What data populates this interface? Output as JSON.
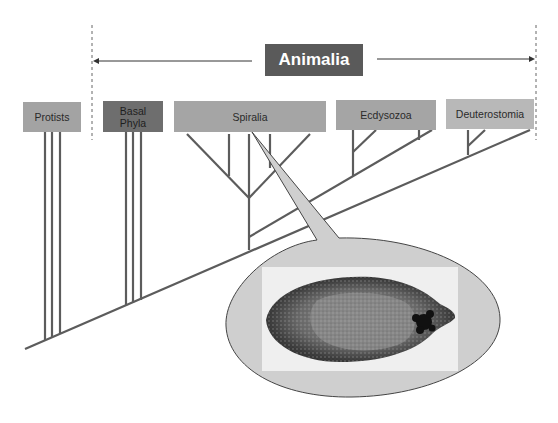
{
  "diagram": {
    "type": "phylogenetic-tree",
    "title": "Animalia",
    "colors": {
      "title_box": "#5a5a5a",
      "protists_box": "#a3a3a3",
      "basal_box": "#6e6e6e",
      "spiralia_box": "#a5a5a5",
      "ecdysozoa_box": "#a5a5a5",
      "deuterostomia_box": "#b8b8b8",
      "branch_line": "#5c5c5c",
      "callout_fill": "#cfcfcf",
      "photo_bg": "#f0f0f0"
    },
    "groups": [
      {
        "id": "protists",
        "label": "Protists"
      },
      {
        "id": "basal",
        "label": "Basal\nPhyla"
      },
      {
        "id": "spiralia",
        "label": "Spiralia"
      },
      {
        "id": "ecdysozoa",
        "label": "Ecdysozoa"
      },
      {
        "id": "deuterostomia",
        "label": "Deuterostomia"
      }
    ],
    "callout": {
      "points_to": "Spiralia",
      "image_description": "flatworm specimen (fluke) photograph, grayscale"
    }
  }
}
